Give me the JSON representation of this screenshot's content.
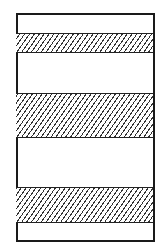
{
  "diagram": {
    "stroke_color": "#1a1a1a",
    "background": "#ffffff",
    "frame": {
      "x": 16,
      "y": 13,
      "width": 137,
      "height": 227
    },
    "bands": [
      {
        "name": "hatched-band-top",
        "y": 33,
        "height": 20,
        "pattern": "diagonal-hatch"
      },
      {
        "name": "hatched-band-middle",
        "y": 93,
        "height": 45,
        "pattern": "diagonal-hatch"
      },
      {
        "name": "hatched-band-bottom",
        "y": 187,
        "height": 36,
        "pattern": "diagonal-hatch"
      }
    ]
  }
}
